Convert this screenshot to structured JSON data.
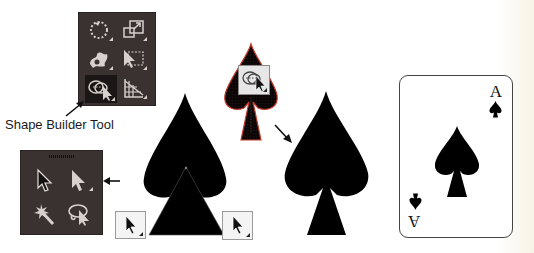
{
  "caption": {
    "shape_builder_label": "Shape Builder Tool"
  },
  "toolbar_panel_top": {
    "tools": [
      {
        "name": "rotate-tool",
        "row": 0,
        "col": 0
      },
      {
        "name": "scale-tool",
        "row": 0,
        "col": 1
      },
      {
        "name": "warp-tool",
        "row": 1,
        "col": 0
      },
      {
        "name": "free-transform-tool",
        "row": 1,
        "col": 1
      },
      {
        "name": "shape-builder-tool",
        "row": 2,
        "col": 0,
        "active": true
      },
      {
        "name": "perspective-grid-tool",
        "row": 2,
        "col": 1
      }
    ]
  },
  "toolbar_panel_bottom": {
    "tools": [
      {
        "name": "selection-tool",
        "row": 0,
        "col": 0
      },
      {
        "name": "direct-selection-tool",
        "row": 0,
        "col": 1
      },
      {
        "name": "magic-wand-tool",
        "row": 1,
        "col": 0
      },
      {
        "name": "lasso-tool",
        "row": 1,
        "col": 1
      }
    ]
  },
  "card": {
    "rank": "A",
    "suit": "spade",
    "rank_rotated": "A"
  },
  "colors": {
    "panel_bg": "#3a3230",
    "panel_active": "#1b1616",
    "shape_fill": "#000000",
    "selected_outline": "#c0392b",
    "tool_box_border": "#9a9a9a"
  }
}
